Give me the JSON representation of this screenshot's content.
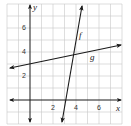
{
  "diagram": {
    "type": "coordinate-plane",
    "grid": {
      "x_min": -2,
      "x_max": 8,
      "y_min": -2,
      "y_max": 8,
      "step": 1,
      "color": "#c8c8c8"
    },
    "axes": {
      "x_label": "x",
      "y_label": "y",
      "x_ticks": [
        "2",
        "4",
        "6"
      ],
      "y_ticks": [
        "2",
        "4",
        "6"
      ],
      "color": "#1a1a1a"
    },
    "lines": [
      {
        "name": "f",
        "label": "f",
        "description": "steep line crossing x-axis near x=3.2",
        "from": [
          2.78,
          -1.9
        ],
        "to": [
          4.52,
          7.9
        ]
      },
      {
        "name": "g",
        "label": "g",
        "description": "shallow line crossing y-axis at y=3",
        "from": [
          -1.8,
          2.65
        ],
        "to": [
          8.0,
          4.6
        ]
      }
    ],
    "intersection": {
      "approx": [
        3.9,
        3.8
      ]
    }
  }
}
